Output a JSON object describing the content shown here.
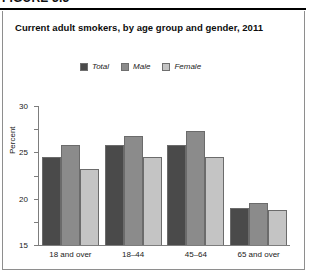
{
  "figure": {
    "label": "FIGURE 3.3"
  },
  "title": "Current adult smokers, by age group and gender, 2011",
  "legend": {
    "items": [
      {
        "label": "Total",
        "color": "#4a4a4a",
        "key": "total"
      },
      {
        "label": "Male",
        "color": "#8b8b8b",
        "key": "male"
      },
      {
        "label": "Female",
        "color": "#c4c4c4",
        "key": "female"
      }
    ]
  },
  "axis": {
    "ylabel": "Percent",
    "yticks": [
      "0",
      "5",
      "10",
      "15",
      "20",
      "25",
      "30"
    ]
  },
  "chart_data": {
    "type": "bar",
    "title": "Current adult smokers, by age group and gender, 2011",
    "xlabel": "",
    "ylabel": "Percent",
    "ylim": [
      0,
      30
    ],
    "ytick_step": 5,
    "grid": false,
    "legend_position": "top-center",
    "categories": [
      "18 and over",
      "18–44",
      "45–64",
      "65 and over"
    ],
    "series": [
      {
        "name": "Total",
        "color": "#4a4a4a",
        "values": [
          19.0,
          21.5,
          21.5,
          8.0
        ]
      },
      {
        "name": "Male",
        "color": "#8b8b8b",
        "values": [
          21.5,
          23.5,
          24.5,
          9.0
        ]
      },
      {
        "name": "Female",
        "color": "#c4c4c4",
        "values": [
          16.5,
          19.0,
          19.0,
          7.5
        ]
      }
    ]
  }
}
